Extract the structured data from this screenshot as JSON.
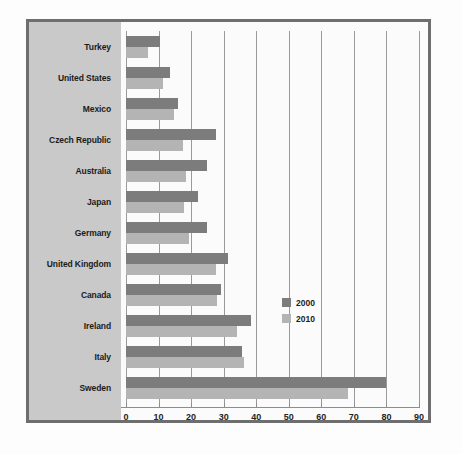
{
  "chart_data": {
    "type": "bar",
    "orientation": "horizontal",
    "title": "",
    "subtitle": "",
    "xlabel": "",
    "ylabel": "",
    "xlim": [
      0,
      90
    ],
    "xticks": [
      0,
      10,
      20,
      30,
      40,
      50,
      60,
      70,
      80,
      90
    ],
    "xtick_labels": [
      "0",
      "10",
      "20",
      "30",
      "40",
      "50",
      "60",
      "70",
      "80",
      "90"
    ],
    "grid": "vertical",
    "legend_position": "right-middle",
    "categories": [
      "Turkey",
      "United States",
      "Mexico",
      "Czech Republic",
      "Australia",
      "Japan",
      "Germany",
      "United Kingdom",
      "Canada",
      "Ireland",
      "Italy",
      "Sweden"
    ],
    "series": [
      {
        "name": "2000",
        "color": "#7c7c7c",
        "values": [
          10.4,
          13.5,
          16.0,
          27.6,
          25.0,
          22.0,
          24.8,
          31.3,
          29.2,
          38.4,
          35.6,
          79.8
        ]
      },
      {
        "name": "2010",
        "color": "#b4b4b4",
        "values": [
          6.7,
          11.3,
          14.7,
          17.5,
          18.4,
          17.8,
          19.3,
          27.6,
          27.9,
          34.0,
          36.2,
          68.1
        ]
      }
    ]
  },
  "legend": {
    "entries": [
      {
        "label": "2000",
        "color": "#7c7c7c"
      },
      {
        "label": "2010",
        "color": "#b4b4b4"
      }
    ]
  },
  "colors": {
    "frame_border": "#6e6e6e",
    "label_panel": "#c9c9c9",
    "plot_background": "#fbfbfb",
    "gridline": "#9a9a9a",
    "axis": "#8d8d8d",
    "text": "#1b1b1b"
  }
}
